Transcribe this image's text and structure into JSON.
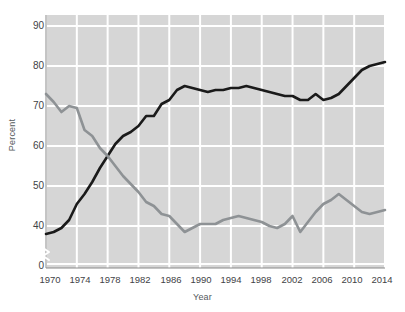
{
  "chart_data": {
    "type": "line",
    "title": "",
    "xlabel": "Year",
    "ylabel": "Percent",
    "xlim": [
      1970,
      2014
    ],
    "ylim": [
      36,
      92
    ],
    "grid": true,
    "axis_break": true,
    "legend_position": "inline-annotations",
    "xticks": [
      1970,
      1974,
      1978,
      1982,
      1986,
      1990,
      1994,
      1998,
      2002,
      2006,
      2010,
      2014
    ],
    "yticks": [
      0,
      40,
      50,
      60,
      70,
      80,
      90
    ],
    "x": [
      1970,
      1971,
      1972,
      1973,
      1974,
      1975,
      1976,
      1977,
      1978,
      1979,
      1980,
      1981,
      1982,
      1983,
      1984,
      1985,
      1986,
      1987,
      1988,
      1989,
      1990,
      1991,
      1992,
      1993,
      1994,
      1995,
      1996,
      1997,
      1998,
      1999,
      2000,
      2001,
      2002,
      2003,
      2004,
      2005,
      2006,
      2007,
      2008,
      2009,
      2010,
      2011,
      2012,
      2013,
      2014
    ],
    "series": [
      {
        "name": "Be very well-off financially",
        "color": "#1a1a1a",
        "values": [
          38.0,
          38.5,
          39.5,
          41.5,
          45.5,
          48.0,
          51.0,
          54.5,
          57.5,
          60.5,
          62.5,
          63.5,
          65.0,
          67.5,
          67.5,
          70.5,
          71.5,
          74.0,
          75.0,
          74.5,
          74.0,
          73.5,
          74.0,
          74.0,
          74.5,
          74.5,
          75.0,
          74.5,
          74.0,
          73.5,
          73.0,
          72.5,
          72.5,
          71.5,
          71.5,
          73.0,
          71.5,
          72.0,
          73.0,
          75.0,
          77.0,
          79.0,
          80.0,
          80.5,
          81.0
        ]
      },
      {
        "name": "Develop a meaningful philosophy of life",
        "color": "#8e9295",
        "values": [
          73.0,
          71.0,
          68.5,
          70.0,
          69.5,
          64.0,
          62.5,
          59.5,
          57.5,
          55.0,
          52.5,
          50.5,
          48.5,
          46.0,
          45.0,
          43.0,
          42.5,
          40.5,
          38.5,
          39.5,
          40.5,
          40.5,
          40.5,
          41.5,
          42.0,
          42.5,
          42.0,
          41.5,
          41.0,
          40.0,
          39.5,
          40.5,
          42.5,
          38.5,
          41.0,
          43.5,
          45.5,
          46.5,
          48.0,
          46.5,
          45.0,
          43.5,
          43.0,
          43.5,
          44.0
        ]
      }
    ],
    "annotations": [
      {
        "id": "annot-black",
        "line1": "Be very well-off",
        "line2": "financially"
      },
      {
        "id": "annot-gray",
        "line1": "Develop a meaningful",
        "line2": "philosophy of life"
      }
    ],
    "colors": {
      "plot_background": "#d6d6d6",
      "gridline": "#ffffff",
      "axis": "#8a8a8a",
      "tick_text": "#3f4346",
      "label_text": "#55595c",
      "series_black": "#1a1a1a",
      "series_gray": "#8e9295"
    }
  }
}
